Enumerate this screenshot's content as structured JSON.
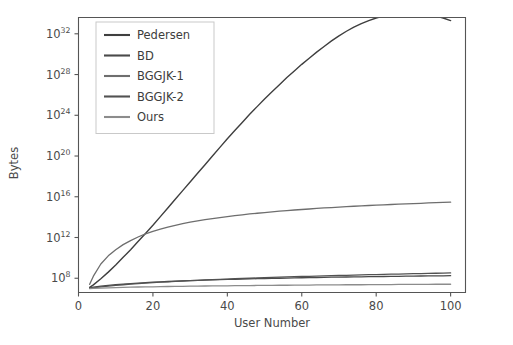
{
  "chart_data": {
    "type": "line",
    "title": "",
    "xlabel": "User Number",
    "ylabel": "Bytes",
    "xlim": [
      0,
      104
    ],
    "ylim_log10": [
      6.6,
      33.6
    ],
    "yscale": "log",
    "xscale": "linear",
    "grid": false,
    "legend_position": "upper left",
    "xticks": [
      0,
      20,
      40,
      60,
      80,
      100
    ],
    "xtick_labels": [
      "0",
      "20",
      "40",
      "60",
      "80",
      "100"
    ],
    "yticks_log10": [
      8,
      12,
      16,
      20,
      24,
      28,
      32
    ],
    "ytick_labels": [
      "10⁸",
      "10¹²",
      "10¹⁶",
      "10²⁰",
      "10²⁴",
      "10²⁸",
      "10³²"
    ],
    "ytick_bases": [
      "10",
      "10",
      "10",
      "10",
      "10",
      "10",
      "10"
    ],
    "ytick_exponents": [
      "8",
      "12",
      "16",
      "20",
      "24",
      "28",
      "32"
    ],
    "x": [
      3,
      4,
      6,
      8,
      10,
      12,
      14,
      16,
      18,
      20,
      22,
      24,
      26,
      28,
      30,
      32,
      34,
      36,
      38,
      40,
      42,
      44,
      46,
      48,
      50,
      52,
      54,
      56,
      58,
      60,
      62,
      64,
      66,
      68,
      70,
      72,
      74,
      76,
      78,
      80,
      82,
      84,
      86,
      88,
      90,
      92,
      94,
      96,
      98,
      100
    ],
    "series": [
      {
        "name": "Pedersen",
        "color": "#3f3f3f",
        "linewidth": 1.4,
        "values_log10": [
          6.95,
          7.55,
          8.75,
          9.95,
          11.15,
          12.35,
          13.55,
          14.75,
          15.95,
          17.15,
          18.35,
          19.55,
          20.75,
          21.95,
          23.15,
          24.35,
          25.55,
          26.75,
          27.95,
          29.15,
          30.35,
          31.55,
          32.75,
          33.95,
          35.15,
          36.35,
          37.55,
          38.75,
          39.95,
          41.15,
          42.35,
          43.55,
          44.75,
          45.95,
          47.15,
          48.35,
          49.55,
          50.75,
          51.95,
          53.15,
          54.35,
          55.55,
          56.75,
          57.95,
          59.15,
          60.35,
          61.55,
          62.75,
          63.95,
          65.15
        ],
        "values_log10_plot": [
          7.1,
          7.35,
          7.95,
          8.6,
          9.3,
          10.05,
          10.8,
          11.6,
          12.4,
          13.2,
          14.05,
          14.9,
          15.75,
          16.6,
          17.45,
          18.3,
          19.15,
          20.0,
          20.85,
          21.7,
          22.5,
          23.3,
          24.1,
          24.85,
          25.6,
          26.3,
          27.0,
          27.7,
          28.35,
          29.0,
          29.6,
          30.2,
          30.75,
          31.3,
          31.8,
          32.25,
          32.65,
          33.0,
          33.3,
          33.55,
          33.75,
          33.9,
          34.0,
          34.05,
          34.05,
          34.0,
          33.9,
          33.75,
          33.55,
          33.3
        ]
      },
      {
        "name": "BD",
        "color": "#4a4a4a",
        "linewidth": 1.3,
        "values_log10": [
          7.05,
          7.12,
          7.22,
          7.3,
          7.37,
          7.43,
          7.48,
          7.53,
          7.57,
          7.61,
          7.65,
          7.68,
          7.71,
          7.74,
          7.77,
          7.79,
          7.82,
          7.84,
          7.86,
          7.88,
          7.9,
          7.92,
          7.94,
          7.96,
          7.97,
          7.99,
          8.0,
          8.02,
          8.03,
          8.05,
          8.06,
          8.07,
          8.09,
          8.1,
          8.11,
          8.12,
          8.13,
          8.14,
          8.15,
          8.16,
          8.17,
          8.18,
          8.19,
          8.2,
          8.21,
          8.22,
          8.23,
          8.24,
          8.24,
          8.25
        ]
      },
      {
        "name": "BGGJK-1",
        "color": "#6e6e6e",
        "linewidth": 1.3,
        "values_log10": [
          7.4,
          8.2,
          9.4,
          10.2,
          10.8,
          11.3,
          11.7,
          12.05,
          12.35,
          12.6,
          12.82,
          13.02,
          13.2,
          13.36,
          13.5,
          13.63,
          13.75,
          13.86,
          13.96,
          14.06,
          14.15,
          14.23,
          14.31,
          14.38,
          14.45,
          14.52,
          14.58,
          14.64,
          14.7,
          14.75,
          14.8,
          14.85,
          14.9,
          14.94,
          14.99,
          15.03,
          15.07,
          15.1,
          15.14,
          15.18,
          15.21,
          15.24,
          15.27,
          15.3,
          15.33,
          15.36,
          15.39,
          15.42,
          15.44,
          15.47
        ]
      },
      {
        "name": "BGGJK-2",
        "color": "#525252",
        "linewidth": 1.3,
        "values_log10": [
          7.0,
          7.06,
          7.15,
          7.23,
          7.3,
          7.36,
          7.42,
          7.47,
          7.52,
          7.57,
          7.61,
          7.65,
          7.69,
          7.73,
          7.76,
          7.8,
          7.83,
          7.86,
          7.89,
          7.92,
          7.95,
          7.98,
          8.0,
          8.03,
          8.05,
          8.08,
          8.1,
          8.13,
          8.15,
          8.17,
          8.19,
          8.21,
          8.23,
          8.25,
          8.27,
          8.29,
          8.31,
          8.33,
          8.35,
          8.36,
          8.38,
          8.4,
          8.41,
          8.43,
          8.45,
          8.46,
          8.48,
          8.49,
          8.51,
          8.52
        ]
      },
      {
        "name": "Ours",
        "color": "#8c8c8c",
        "linewidth": 1.3,
        "values_log10": [
          6.98,
          7.0,
          7.03,
          7.06,
          7.08,
          7.1,
          7.12,
          7.14,
          7.15,
          7.16,
          7.18,
          7.19,
          7.2,
          7.21,
          7.22,
          7.23,
          7.24,
          7.25,
          7.25,
          7.26,
          7.27,
          7.28,
          7.28,
          7.29,
          7.3,
          7.3,
          7.31,
          7.31,
          7.32,
          7.33,
          7.33,
          7.34,
          7.34,
          7.35,
          7.35,
          7.36,
          7.36,
          7.36,
          7.37,
          7.37,
          7.38,
          7.38,
          7.39,
          7.39,
          7.39,
          7.4,
          7.4,
          7.41,
          7.41,
          7.41
        ]
      }
    ],
    "legend_entries": [
      "Pedersen",
      "BD",
      "BGGJK-1",
      "BGGJK-2",
      "Ours"
    ]
  },
  "axes": {
    "x_axis_title": "User Number",
    "y_axis_title": "Bytes"
  }
}
